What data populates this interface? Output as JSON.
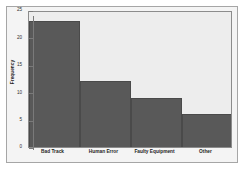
{
  "chart_data": {
    "type": "bar",
    "title": "",
    "subtitle": "",
    "xlabel": "",
    "ylabel": "Frequency",
    "categories": [
      "Bad Track",
      "Human Error",
      "Faulty Equipment",
      "Other"
    ],
    "values": [
      23,
      12,
      9,
      6
    ],
    "ylim": [
      0,
      25
    ],
    "yticks": [
      0,
      5,
      10,
      15,
      20,
      25
    ],
    "ytick_labels": [
      "0",
      "5",
      "10",
      "15",
      "20",
      "25"
    ],
    "grid": false,
    "legend": false,
    "legend_position": "none",
    "bar_color": "#595959",
    "plot_background": "#ededed",
    "figure_background": "#f4f4f4",
    "axis_color": "#7a7a7a",
    "frame_color": "#a6a6a6"
  }
}
